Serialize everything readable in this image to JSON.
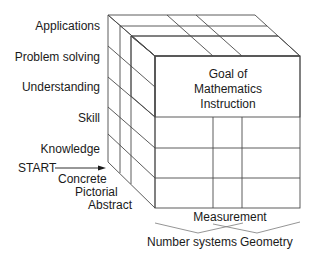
{
  "diagram": {
    "colors": {
      "goal_fill": "#b9b9b9",
      "goal_top": "#c4c4c4",
      "goal_side": "#a9a9a9",
      "line": "#4a4a4a",
      "background": "#ffffff"
    },
    "vertical_axis_labels": [
      "Applications",
      "Problem solving",
      "Understanding",
      "Skill",
      "Knowledge"
    ],
    "start_label": "START",
    "depth_axis_labels": [
      "Concrete",
      "Pictorial",
      "Abstract"
    ],
    "goal_block": {
      "line1": "Goal of",
      "line2": "Mathematics",
      "line3": "Instruction"
    },
    "content_axis_labels": {
      "middle": "Measurement",
      "left": "Number systems",
      "right": "Geometry"
    }
  }
}
